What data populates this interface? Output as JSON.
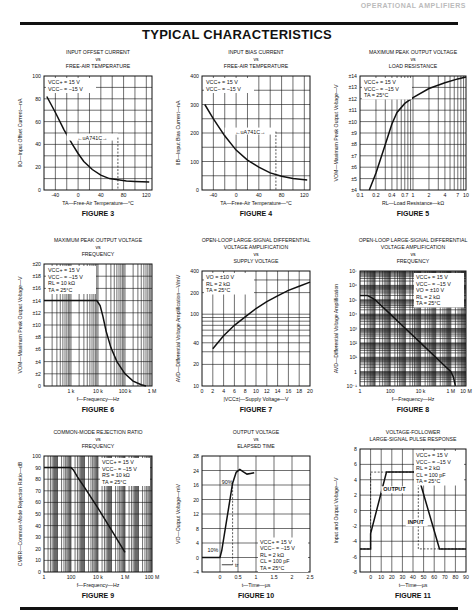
{
  "header": {
    "running_title": "OPERATIONAL AMPLIFIERS",
    "page_title": "TYPICAL CHARACTERISTICS"
  },
  "chart_data": [
    {
      "id": "figure3",
      "type": "line",
      "caption": "FIGURE 3",
      "title": [
        "INPUT OFFSET CURRENT",
        "vs",
        "FREE-AIR TEMPERATURE"
      ],
      "xlabel": "TA—Free-Air Temperature—°C",
      "ylabel": "IIO—Input Offset Current—nA",
      "xlim": [
        -60,
        130
      ],
      "ylim": [
        0,
        100
      ],
      "xticks": [
        -40,
        0,
        40,
        80,
        120
      ],
      "yticks": [
        0,
        20,
        40,
        60,
        80,
        100
      ],
      "legend": [
        "VCC+ = 15 V",
        "VCC− = −15 V"
      ],
      "annotation": "←uA741C→",
      "annotation_range": [
        -60,
        70
      ],
      "x": [
        -55,
        -40,
        -25,
        -10,
        0,
        10,
        25,
        40,
        55,
        70,
        85,
        100,
        125
      ],
      "y": [
        82,
        68,
        53,
        40,
        32,
        25,
        18,
        13,
        10,
        9,
        8,
        7.5,
        7
      ]
    },
    {
      "id": "figure4",
      "type": "line",
      "caption": "FIGURE 4",
      "title": [
        "INPUT BIAS CURRENT",
        "vs",
        "FREE-AIR TEMPERATURE"
      ],
      "xlabel": "TA—Free-Air Temperature—°C",
      "ylabel": "IIB—Input Bias Current—nA",
      "xlim": [
        -60,
        130
      ],
      "ylim": [
        0,
        400
      ],
      "xticks": [
        -40,
        0,
        40,
        80,
        120
      ],
      "yticks": [
        0,
        100,
        200,
        300,
        400
      ],
      "legend": [
        "VCC+ = 15 V",
        "VCC− = −15 V"
      ],
      "annotation": "←uA741C→",
      "annotation_range": [
        -60,
        70
      ],
      "x": [
        -55,
        -40,
        -20,
        0,
        20,
        40,
        60,
        80,
        100,
        125
      ],
      "y": [
        300,
        250,
        190,
        140,
        105,
        80,
        60,
        48,
        40,
        35
      ]
    },
    {
      "id": "figure5",
      "type": "line",
      "caption": "FIGURE 5",
      "title": [
        "MAXIMUM PEAK OUTPUT VOLTAGE",
        "vs",
        "LOAD RESISTANCE"
      ],
      "xlabel": "RL—Load Resistance—kΩ",
      "ylabel": "VOM—Maximum Peak Output Voltage—V",
      "xscale": "log",
      "xlim": [
        0.1,
        10
      ],
      "ylim": [
        4,
        14
      ],
      "xticks": [
        0.1,
        0.2,
        0.4,
        0.7,
        1,
        2,
        4,
        7,
        10
      ],
      "xticklabels": [
        "0.1",
        "0.2",
        "0.4",
        "0.7",
        "1",
        "2",
        "4",
        "7",
        "10"
      ],
      "yticks": [
        4,
        5,
        6,
        7,
        8,
        9,
        10,
        11,
        12,
        13,
        14
      ],
      "yticklabels": [
        "±4",
        "±5",
        "±6",
        "±7",
        "±8",
        "±9",
        "±10",
        "±11",
        "±12",
        "±13",
        "±14"
      ],
      "legend": [
        "VCC+ = 15 V",
        "VCC− = −15 V",
        "TA = 25°C"
      ],
      "x": [
        0.15,
        0.2,
        0.3,
        0.4,
        0.5,
        0.7,
        1,
        2,
        4,
        7,
        10
      ],
      "y": [
        4,
        5.5,
        8,
        9.8,
        10.8,
        11.6,
        12.1,
        12.9,
        13.4,
        13.75,
        13.9
      ]
    },
    {
      "id": "figure6",
      "type": "line",
      "caption": "FIGURE 6",
      "title": [
        "MAXIMUM PEAK OUTPUT VOLTAGE",
        "vs",
        "FREQUENCY"
      ],
      "xlabel": "f—Frequency—Hz",
      "ylabel": "VOM—Maximum Peak Output Voltage—V",
      "xscale": "log",
      "xlim": [
        100,
        1000000
      ],
      "ylim": [
        0,
        20
      ],
      "xticks": [
        1000,
        10000,
        100000,
        1000000
      ],
      "xticklabels": [
        "1 k",
        "10 k",
        "100 k",
        "1 M"
      ],
      "yticks": [
        0,
        2,
        4,
        6,
        8,
        10,
        12,
        14,
        16,
        18,
        20
      ],
      "yticklabels": [
        "0",
        "±2",
        "±4",
        "±6",
        "±8",
        "±10",
        "±12",
        "±14",
        "±16",
        "±18",
        "±20"
      ],
      "legend": [
        "VCC+ = 15 V",
        "VCC− = −15 V",
        "RL = 10 kΩ",
        "TA = 25°C"
      ],
      "x": [
        100,
        1000,
        5000,
        9000,
        12000,
        15000,
        20000,
        30000,
        50000,
        100000,
        200000,
        400000,
        600000
      ],
      "y": [
        14,
        14,
        14,
        14,
        13.2,
        11.5,
        9,
        6.3,
        4,
        2,
        0.8,
        0.2,
        0
      ]
    },
    {
      "id": "figure7",
      "type": "line",
      "caption": "FIGURE 7",
      "title": [
        "OPEN-LOOP LARGE-SIGNAL DIFFERENTIAL",
        "VOLTAGE AMPLIFICATION",
        "vs",
        "SUPPLY VOLTAGE"
      ],
      "xlabel": "|VCC±|—Supply Voltage—V",
      "ylabel": "AVD—Differential Voltage Amplification—V/mV",
      "yscale": "log",
      "xlim": [
        0,
        20
      ],
      "ylim": [
        10,
        400
      ],
      "xticks": [
        0,
        2,
        4,
        6,
        8,
        10,
        12,
        14,
        16,
        18,
        20
      ],
      "yticks": [
        10,
        20,
        40,
        100,
        200,
        400
      ],
      "legend": [
        "VO = ±10 V",
        "RL = 2 kΩ",
        "TA = 25°C"
      ],
      "x": [
        2,
        4,
        6,
        8,
        10,
        12,
        14,
        16,
        18,
        20
      ],
      "y": [
        33,
        50,
        70,
        92,
        120,
        150,
        180,
        215,
        245,
        280
      ]
    },
    {
      "id": "figure8",
      "type": "line",
      "caption": "FIGURE 8",
      "title": [
        "OPEN-LOOP LARGE-SIGNAL DIFFERENTIAL",
        "VOLTAGE AMPLIFICATION",
        "vs",
        "FREQUENCY"
      ],
      "xlabel": "f—Frequency—Hz",
      "ylabel": "AVD—Differential Voltage Amplification",
      "xscale": "log",
      "yscale": "log",
      "xlim": [
        1,
        10000000
      ],
      "ylim": [
        0.1,
        10000000
      ],
      "xticks": [
        1,
        100,
        10000,
        1000000,
        10000000
      ],
      "xticklabels": [
        "1",
        "100",
        "10 k",
        "1 M",
        "10 M"
      ],
      "yticks": [
        0.1,
        1,
        10,
        100,
        1000,
        10000,
        100000,
        1000000,
        10000000
      ],
      "yticklabels": [
        "10⁻¹",
        "1",
        "10¹",
        "10²",
        "10³",
        "10⁴",
        "10⁵",
        "10⁶",
        "10⁷"
      ],
      "legend": [
        "VCC+ = 15 V",
        "VCC− = −15 V",
        "VO = ±10 V",
        "RL = 2 kΩ",
        "TA = 25°C"
      ],
      "x": [
        1,
        3,
        5,
        10,
        100,
        1000,
        10000,
        100000,
        1000000,
        1500000,
        2000000
      ],
      "y": [
        200000,
        200000,
        150000,
        100000,
        10000,
        1000,
        100,
        10,
        1,
        0.4,
        0.1
      ]
    },
    {
      "id": "figure9",
      "type": "line",
      "caption": "FIGURE 9",
      "title": [
        "COMMON-MODE REJECTION RATIO",
        "vs",
        "FREQUENCY"
      ],
      "xlabel": "f—Frequency—Hz",
      "ylabel": "CMRR—Common-Mode Rejection Ratio—dB",
      "xscale": "log",
      "xlim": [
        1,
        100000000
      ],
      "ylim": [
        0,
        100
      ],
      "xticks": [
        1,
        100,
        10000,
        1000000,
        100000000
      ],
      "xticklabels": [
        "1",
        "100",
        "10 k",
        "1 M",
        "100 M"
      ],
      "yticks": [
        0,
        10,
        20,
        30,
        40,
        50,
        60,
        70,
        80,
        90,
        100
      ],
      "legend": [
        "VCC+ = 15 V",
        "VCC− = −15 V",
        "RS = 10 kΩ",
        "TA = 25°C"
      ],
      "x": [
        1,
        10,
        100,
        150,
        300,
        1000,
        10000,
        100000,
        1000000
      ],
      "y": [
        90,
        90,
        90,
        88,
        82,
        73,
        55,
        36,
        17
      ]
    },
    {
      "id": "figure10",
      "type": "line",
      "caption": "FIGURE 10",
      "title": [
        "OUTPUT VOLTAGE",
        "vs",
        "ELAPSED TIME"
      ],
      "xlabel": "t—Time—µs",
      "ylabel": "VO—Output Voltage—mV",
      "xlim": [
        -0.5,
        2.5
      ],
      "ylim": [
        -4,
        28
      ],
      "xticks": [
        0,
        0.5,
        1,
        1.5,
        2,
        2.5
      ],
      "xticklabels": [
        "0",
        "0.5",
        "1",
        "1.5",
        "2",
        "2.5"
      ],
      "yticks": [
        -4,
        0,
        4,
        8,
        12,
        16,
        20,
        24,
        28
      ],
      "yticklabels": [
        "−4",
        "0",
        "4",
        "8",
        "12",
        "20",
        "16",
        "24",
        "28"
      ],
      "legend": [
        "VCC+ = 15 V",
        "VCC− = −15 V",
        "RL = 2 kΩ",
        "CL = 100 pF",
        "TA = 25°C"
      ],
      "annotations": [
        "90%",
        "10%",
        "tr"
      ],
      "x": [
        -0.5,
        0,
        0.05,
        0.35,
        0.45,
        0.55,
        0.65,
        0.75,
        0.85,
        0.95
      ],
      "y": [
        0,
        0,
        2,
        20.5,
        23.5,
        24.3,
        23.6,
        23,
        23.2,
        23.4
      ]
    },
    {
      "id": "figure11",
      "type": "line",
      "caption": "FIGURE 11",
      "title": [
        "VOLTAGE-FOLLOWER",
        "LARGE-SIGNAL PULSE RESPONSE"
      ],
      "xlabel": "t—Time—µs",
      "ylabel": "Input and Output Voltage—V",
      "xlim": [
        -10,
        90
      ],
      "ylim": [
        -8,
        8
      ],
      "xticks": [
        0,
        10,
        20,
        30,
        40,
        50,
        60,
        70,
        80,
        90
      ],
      "yticks": [
        -8,
        -6,
        -4,
        -2,
        0,
        2,
        4,
        6,
        8
      ],
      "legend": [
        "VCC+ = 15 V",
        "VCC− = −15 V",
        "RL = 2 kΩ",
        "CL = 100 pF",
        "TA = 25°C"
      ],
      "series": [
        {
          "name": "OUTPUT",
          "style": "solid",
          "x": [
            -10,
            0,
            0,
            15,
            45,
            46,
            65,
            90
          ],
          "y": [
            -5,
            -5,
            -3,
            5,
            5,
            4,
            -5,
            -5
          ]
        },
        {
          "name": "INPUT",
          "style": "dashed",
          "x": [
            -10,
            0,
            0,
            45,
            45,
            90
          ],
          "y": [
            -5,
            -5,
            5,
            5,
            -5,
            -5
          ]
        }
      ]
    }
  ]
}
